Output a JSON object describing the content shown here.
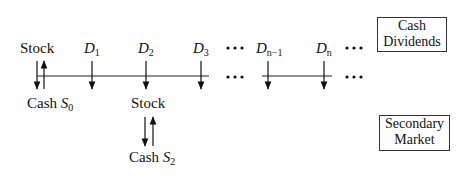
{
  "timeline": {
    "start_label": "Stock",
    "dividends": [
      {
        "symbol": "D",
        "subscript": "1"
      },
      {
        "symbol": "D",
        "subscript": "2"
      },
      {
        "symbol": "D",
        "subscript": "3"
      },
      {
        "symbol": "D",
        "subscript": "n−1"
      },
      {
        "symbol": "D",
        "subscript": "n"
      }
    ],
    "ellipsis": "•••",
    "initial_cash": {
      "text": "Cash ",
      "symbol": "S",
      "subscript": "0"
    }
  },
  "secondary_trade": {
    "stock_label": "Stock",
    "cash": {
      "text": "Cash ",
      "symbol": "S",
      "subscript": "2"
    }
  },
  "legend": {
    "cash_dividends": [
      "Cash",
      "Dividends"
    ],
    "secondary_market": [
      "Secondary",
      "Market"
    ]
  }
}
